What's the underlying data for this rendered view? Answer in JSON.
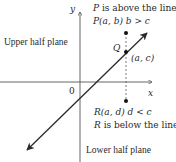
{
  "diagram": {
    "axes": {
      "y_label": "y",
      "x_label": "x",
      "origin_label": "0"
    },
    "regions": {
      "upper": "Upper half plane",
      "lower": "Lower half plane"
    },
    "points": {
      "P": {
        "caption": "P is above the line",
        "caption_letter": "P",
        "caption_rest": " is above the line",
        "coord_label": "P(a, b) b > c"
      },
      "Q": {
        "label": "Q",
        "coord_label": "(a, c)"
      },
      "R": {
        "coord_label": "R(a, d) d < c",
        "caption": "R is below the line",
        "caption_letter": "R",
        "caption_rest": " is below the line"
      }
    },
    "colors": {
      "line": "#2a2a2a",
      "axis": "#555555",
      "background": "#ffffff"
    }
  }
}
